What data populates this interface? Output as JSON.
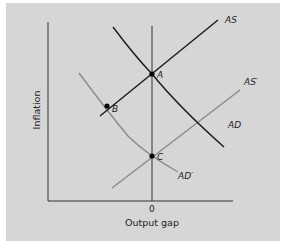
{
  "diagram": {
    "xlabel": "Output gap",
    "ylabel": "Inflation",
    "x_tick": "0",
    "colors": {
      "background": "#d6d6d6",
      "primary_curves": "#1a1a1a",
      "shifted_curves": "#8a8a8a",
      "axes": "#333333"
    },
    "curves": {
      "as": "AS",
      "ad": "AD",
      "as_shift": "AS′",
      "ad_shift": "AD′"
    },
    "points": {
      "a": "A",
      "b": "B",
      "c": "C"
    }
  }
}
